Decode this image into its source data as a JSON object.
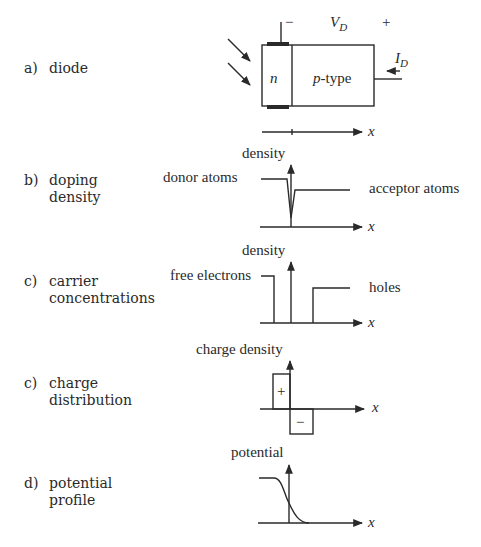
{
  "figure": {
    "rows": [
      {
        "letter": "a)",
        "text": "diode"
      },
      {
        "letter": "b)",
        "text": "doping\ndensity"
      },
      {
        "letter": "c)",
        "text": "carrier\nconcentrations"
      },
      {
        "letter": "c)",
        "text": "charge\ndistribution"
      },
      {
        "letter": "d)",
        "text": "potential\nprofile"
      }
    ],
    "diode": {
      "n_label": "n",
      "p_label": "p-type",
      "voltage_label": "V_D",
      "voltage_sub": "D",
      "voltage_main": "V",
      "minus": "−",
      "plus": "+",
      "current_main": "I",
      "current_sub": "D",
      "axis_label": "x"
    },
    "doping": {
      "y_label": "density",
      "left_label": "donor atoms",
      "right_label": "acceptor atoms",
      "axis_label": "x"
    },
    "carriers": {
      "y_label": "density",
      "left_label": "free electrons",
      "right_label": "holes",
      "axis_label": "x"
    },
    "charge": {
      "y_label": "charge density",
      "pos_sign": "+",
      "neg_sign": "−",
      "axis_label": "x"
    },
    "potential": {
      "y_label": "potential",
      "axis_label": "x"
    }
  }
}
